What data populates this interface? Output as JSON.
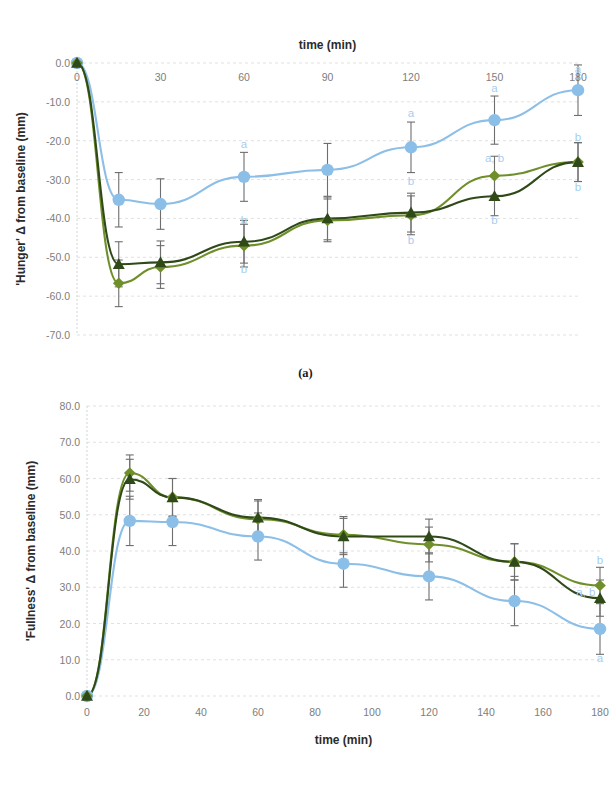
{
  "figure": {
    "panel_a_caption": "(a)",
    "panel_b_caption": "(b)"
  },
  "colors": {
    "series_blue": "#8cbfe8",
    "series_midgreen": "#6f8f2a",
    "series_darkgreen": "#2f4a18",
    "errorbar": "#6e6e6e",
    "gridline": "#d9d9d9",
    "tick_text": "#7d7d7d",
    "axis_title": "#2b2b2b",
    "significance_text": "#a8cdf0"
  },
  "chart_data": [
    {
      "id": "panel-a",
      "type": "line",
      "title": "",
      "xlabel": "time (min)",
      "ylabel": "'Hunger' Δ from baseline (mm)",
      "xlabel_position": "top",
      "xlim": [
        0,
        180
      ],
      "ylim": [
        -70,
        0
      ],
      "xticks": [
        0,
        30,
        60,
        90,
        120,
        150,
        180
      ],
      "xtick_labels": [
        "0",
        "30",
        "60",
        "90",
        "120",
        "150",
        "180"
      ],
      "yticks": [
        0,
        -10,
        -20,
        -30,
        -40,
        -50,
        -60,
        -70
      ],
      "ytick_labels": [
        "0.0",
        "-10.0",
        "-20.0",
        "-30.0",
        "-40.0",
        "-50.0",
        "-60.0",
        "-70.0"
      ],
      "grid": true,
      "legend": "none",
      "x": [
        0,
        15,
        30,
        60,
        90,
        120,
        150,
        180
      ],
      "series": [
        {
          "name": "series-blue",
          "marker": "circle",
          "color": "#8cbfe8",
          "values": [
            0.0,
            -35.2,
            -36.3,
            -29.3,
            -27.5,
            -21.7,
            -14.7,
            -7.0
          ],
          "errors": [
            0.0,
            7.0,
            6.5,
            6.3,
            6.8,
            6.5,
            6.2,
            6.5
          ]
        },
        {
          "name": "series-midgreen",
          "marker": "diamond",
          "color": "#6f8f2a",
          "values": [
            0.0,
            -56.7,
            -52.5,
            -47.0,
            -40.5,
            -39.2,
            -29.0,
            -25.5
          ],
          "errors": [
            0.0,
            6.0,
            5.5,
            5.5,
            5.5,
            5.0,
            5.0,
            5.0
          ]
        },
        {
          "name": "series-darkgreen",
          "marker": "triangle",
          "color": "#2f4a18",
          "values": [
            0.0,
            -51.8,
            -51.3,
            -46.0,
            -40.0,
            -38.5,
            -34.3,
            -25.5
          ],
          "errors": [
            0.0,
            5.8,
            5.5,
            5.5,
            5.5,
            5.0,
            5.0,
            5.0
          ]
        }
      ],
      "annotations": [
        {
          "text": "a",
          "x": 60,
          "y": -22.0
        },
        {
          "text": "b",
          "x": 60,
          "y": -41.5
        },
        {
          "text": "b",
          "x": 60,
          "y": -54.0
        },
        {
          "text": "a",
          "x": 120,
          "y": -14.0
        },
        {
          "text": "b",
          "x": 120,
          "y": -31.5
        },
        {
          "text": "b",
          "x": 120,
          "y": -46.5
        },
        {
          "text": "a",
          "x": 150,
          "y": -7.5
        },
        {
          "text": "a, b",
          "x": 150,
          "y": -25.5
        },
        {
          "text": "b",
          "x": 150,
          "y": -41.5
        },
        {
          "text": "a",
          "x": 180,
          "y": -2.5
        },
        {
          "text": "b",
          "x": 180,
          "y": -20.0
        },
        {
          "text": "b",
          "x": 180,
          "y": -33.0
        }
      ]
    },
    {
      "id": "panel-b",
      "type": "line",
      "title": "",
      "xlabel": "time (min)",
      "ylabel": "'Fullness' Δ from baseline (mm)",
      "xlabel_position": "bottom",
      "xlim": [
        0,
        180
      ],
      "ylim": [
        0,
        80
      ],
      "xticks": [
        0,
        20,
        40,
        60,
        80,
        100,
        120,
        140,
        160,
        180
      ],
      "xtick_labels": [
        "0",
        "20",
        "40",
        "60",
        "80",
        "100",
        "120",
        "140",
        "160",
        "180"
      ],
      "yticks": [
        0,
        10,
        20,
        30,
        40,
        50,
        60,
        70,
        80
      ],
      "ytick_labels": [
        "0.0",
        "10.0",
        "20.0",
        "30.0",
        "40.0",
        "50.0",
        "60.0",
        "70.0",
        "80.0"
      ],
      "grid": true,
      "legend": "none",
      "x": [
        0,
        15,
        30,
        60,
        90,
        120,
        150,
        180
      ],
      "series": [
        {
          "name": "series-blue",
          "marker": "circle",
          "color": "#8cbfe8",
          "values": [
            0.0,
            48.3,
            48.0,
            44.0,
            36.5,
            33.0,
            26.2,
            18.5
          ],
          "errors": [
            0.0,
            6.8,
            6.5,
            6.5,
            6.5,
            6.5,
            6.8,
            7.0
          ]
        },
        {
          "name": "series-midgreen",
          "marker": "diamond",
          "color": "#6f8f2a",
          "values": [
            0.0,
            61.5,
            54.8,
            48.8,
            44.5,
            41.8,
            37.0,
            30.5
          ],
          "errors": [
            0.0,
            5.0,
            5.2,
            5.0,
            5.0,
            4.8,
            5.0,
            5.0
          ]
        },
        {
          "name": "series-darkgreen",
          "marker": "triangle",
          "color": "#2f4a18",
          "values": [
            0.0,
            59.8,
            54.8,
            49.2,
            44.0,
            44.0,
            37.0,
            27.0
          ],
          "errors": [
            0.0,
            5.5,
            5.2,
            5.0,
            5.0,
            4.8,
            5.0,
            5.0
          ]
        }
      ],
      "annotations": [
        {
          "text": "b",
          "x": 180,
          "y": 36.5
        },
        {
          "text": "a, b",
          "x": 175,
          "y": 27.5
        },
        {
          "text": "a",
          "x": 180,
          "y": 9.5
        }
      ]
    }
  ]
}
